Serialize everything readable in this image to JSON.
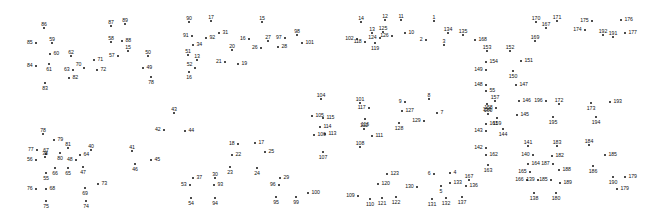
{
  "page": {
    "background_color": "#ffffff",
    "dot_color": "#111111",
    "label_color": "#111111",
    "width": 663,
    "height": 214,
    "total_dots": 195
  },
  "dots": [
    {
      "n": "86",
      "x": 44,
      "y": 28,
      "lp": "lp-t"
    },
    {
      "n": "85",
      "x": 36,
      "y": 43,
      "lp": "lp-l"
    },
    {
      "n": "59",
      "x": 52,
      "y": 43,
      "lp": "lp-t"
    },
    {
      "n": "60",
      "x": 50,
      "y": 54,
      "lp": "lp-r"
    },
    {
      "n": "61",
      "x": 49,
      "y": 64,
      "lp": "lp-b"
    },
    {
      "n": "84",
      "x": 36,
      "y": 66,
      "lp": "lp-l"
    },
    {
      "n": "83",
      "x": 45,
      "y": 83,
      "lp": "lp-b"
    },
    {
      "n": "62",
      "x": 71,
      "y": 56,
      "lp": "lp-t"
    },
    {
      "n": "63",
      "x": 73,
      "y": 70,
      "lp": "lp-l"
    },
    {
      "n": "70",
      "x": 84,
      "y": 68,
      "lp": "lp-tl"
    },
    {
      "n": "71",
      "x": 94,
      "y": 60,
      "lp": "lp-r"
    },
    {
      "n": "72",
      "x": 97,
      "y": 70,
      "lp": "lp-r"
    },
    {
      "n": "82",
      "x": 69,
      "y": 78,
      "lp": "lp-r"
    },
    {
      "n": "87",
      "x": 111,
      "y": 26,
      "lp": "lp-t"
    },
    {
      "n": "89",
      "x": 125,
      "y": 24,
      "lp": "lp-t"
    },
    {
      "n": "58",
      "x": 111,
      "y": 42,
      "lp": "lp-t"
    },
    {
      "n": "88",
      "x": 122,
      "y": 41,
      "lp": "lp-r"
    },
    {
      "n": "15",
      "x": 128,
      "y": 51,
      "lp": "lp-t"
    },
    {
      "n": "57",
      "x": 118,
      "y": 56,
      "lp": "lp-l"
    },
    {
      "n": "50",
      "x": 148,
      "y": 56,
      "lp": "lp-t"
    },
    {
      "n": "49",
      "x": 143,
      "y": 68,
      "lp": "lp-r"
    },
    {
      "n": "78",
      "x": 151,
      "y": 77,
      "lp": "lp-b"
    },
    {
      "n": "90",
      "x": 189,
      "y": 22,
      "lp": "lp-t"
    },
    {
      "n": "17",
      "x": 211,
      "y": 21,
      "lp": "lp-t"
    },
    {
      "n": "31",
      "x": 219,
      "y": 33,
      "lp": "lp-r"
    },
    {
      "n": "91",
      "x": 192,
      "y": 36,
      "lp": "lp-l"
    },
    {
      "n": "92",
      "x": 206,
      "y": 38,
      "lp": "lp-r"
    },
    {
      "n": "34",
      "x": 193,
      "y": 45,
      "lp": "lp-r"
    },
    {
      "n": "51",
      "x": 188,
      "y": 55,
      "lp": "lp-t"
    },
    {
      "n": "13",
      "x": 197,
      "y": 60,
      "lp": "lp-t"
    },
    {
      "n": "52",
      "x": 195,
      "y": 68,
      "lp": "lp-tl"
    },
    {
      "n": "16",
      "x": 189,
      "y": 72,
      "lp": "lp-b"
    },
    {
      "n": "20",
      "x": 232,
      "y": 50,
      "lp": "lp-t"
    },
    {
      "n": "21",
      "x": 225,
      "y": 62,
      "lp": "lp-l"
    },
    {
      "n": "19",
      "x": 238,
      "y": 64,
      "lp": "lp-r"
    },
    {
      "n": "15",
      "x": 262,
      "y": 22,
      "lp": "lp-t"
    },
    {
      "n": "16",
      "x": 249,
      "y": 39,
      "lp": "lp-l"
    },
    {
      "n": "27",
      "x": 268,
      "y": 41,
      "lp": "lp-t"
    },
    {
      "n": "26",
      "x": 261,
      "y": 48,
      "lp": "lp-l"
    },
    {
      "n": "28",
      "x": 278,
      "y": 47,
      "lp": "lp-r"
    },
    {
      "n": "97",
      "x": 285,
      "y": 38,
      "lp": "lp-l"
    },
    {
      "n": "98",
      "x": 297,
      "y": 35,
      "lp": "lp-t"
    },
    {
      "n": "101",
      "x": 302,
      "y": 43,
      "lp": "lp-r"
    },
    {
      "n": "14",
      "x": 361,
      "y": 22,
      "lp": "lp-t"
    },
    {
      "n": "12",
      "x": 385,
      "y": 20,
      "lp": "lp-t"
    },
    {
      "n": "11",
      "x": 401,
      "y": 20,
      "lp": "lp-t"
    },
    {
      "n": "13",
      "x": 372,
      "y": 33,
      "lp": "lp-t"
    },
    {
      "n": "125",
      "x": 383,
      "y": 32,
      "lp": "lp-t"
    },
    {
      "n": "102",
      "x": 357,
      "y": 39,
      "lp": "lp-l"
    },
    {
      "n": "118",
      "x": 365,
      "y": 42,
      "lp": "lp-l"
    },
    {
      "n": "124",
      "x": 380,
      "y": 38,
      "lp": "lp-l"
    },
    {
      "n": "119",
      "x": 375,
      "y": 43,
      "lp": "lp-b"
    },
    {
      "n": "126",
      "x": 392,
      "y": 36,
      "lp": "lp-l"
    },
    {
      "n": "10",
      "x": 405,
      "y": 33,
      "lp": "lp-r"
    },
    {
      "n": "1",
      "x": 434,
      "y": 21,
      "lp": "lp-t"
    },
    {
      "n": "2",
      "x": 426,
      "y": 40,
      "lp": "lp-l"
    },
    {
      "n": "134",
      "x": 448,
      "y": 33,
      "lp": "lp-t"
    },
    {
      "n": "135",
      "x": 463,
      "y": 35,
      "lp": "lp-t"
    },
    {
      "n": "3",
      "x": 444,
      "y": 45,
      "lp": "lp-t"
    },
    {
      "n": "168",
      "x": 475,
      "y": 40,
      "lp": "lp-r"
    },
    {
      "n": "153",
      "x": 487,
      "y": 51,
      "lp": "lp-t"
    },
    {
      "n": "152",
      "x": 510,
      "y": 51,
      "lp": "lp-t"
    },
    {
      "n": "154",
      "x": 486,
      "y": 62,
      "lp": "lp-r"
    },
    {
      "n": "151",
      "x": 521,
      "y": 61,
      "lp": "lp-r"
    },
    {
      "n": "149",
      "x": 486,
      "y": 70,
      "lp": "lp-l"
    },
    {
      "n": "150",
      "x": 513,
      "y": 71,
      "lp": "lp-b"
    },
    {
      "n": "148",
      "x": 486,
      "y": 85,
      "lp": "lp-l"
    },
    {
      "n": "147",
      "x": 516,
      "y": 85,
      "lp": "lp-r"
    },
    {
      "n": "55",
      "x": 486,
      "y": 91,
      "lp": "lp-r"
    },
    {
      "n": "156",
      "x": 487,
      "y": 104,
      "lp": "lp-b"
    },
    {
      "n": "157",
      "x": 495,
      "y": 101,
      "lp": "lp-t"
    },
    {
      "n": "146",
      "x": 519,
      "y": 101,
      "lp": "lp-r"
    },
    {
      "n": "196",
      "x": 546,
      "y": 101,
      "lp": "lp-l"
    },
    {
      "n": "172",
      "x": 559,
      "y": 104,
      "lp": "lp-t"
    },
    {
      "n": "158",
      "x": 496,
      "y": 108,
      "lp": "lp-l"
    },
    {
      "n": "160",
      "x": 488,
      "y": 114,
      "lp": "lp-t"
    },
    {
      "n": "159",
      "x": 497,
      "y": 118,
      "lp": "lp-b"
    },
    {
      "n": "145",
      "x": 517,
      "y": 115,
      "lp": "lp-r"
    },
    {
      "n": "195",
      "x": 553,
      "y": 117,
      "lp": "lp-b"
    },
    {
      "n": "161",
      "x": 486,
      "y": 124,
      "lp": "lp-r"
    },
    {
      "n": "143",
      "x": 486,
      "y": 131,
      "lp": "lp-l"
    },
    {
      "n": "144",
      "x": 503,
      "y": 129,
      "lp": "lp-b"
    },
    {
      "n": "142",
      "x": 486,
      "y": 148,
      "lp": "lp-l"
    },
    {
      "n": "162",
      "x": 486,
      "y": 155,
      "lp": "lp-r"
    },
    {
      "n": "163",
      "x": 488,
      "y": 165,
      "lp": "lp-b"
    },
    {
      "n": "141",
      "x": 528,
      "y": 146,
      "lp": "lp-t"
    },
    {
      "n": "183",
      "x": 557,
      "y": 146,
      "lp": "lp-t"
    },
    {
      "n": "140",
      "x": 533,
      "y": 155,
      "lp": "lp-l"
    },
    {
      "n": "182",
      "x": 552,
      "y": 156,
      "lp": "lp-r"
    },
    {
      "n": "164",
      "x": 528,
      "y": 164,
      "lp": "lp-r"
    },
    {
      "n": "187",
      "x": 553,
      "y": 164,
      "lp": "lp-l"
    },
    {
      "n": "165",
      "x": 530,
      "y": 172,
      "lp": "lp-l"
    },
    {
      "n": "188",
      "x": 559,
      "y": 170,
      "lp": "lp-r"
    },
    {
      "n": "166",
      "x": 527,
      "y": 180,
      "lp": "lp-l"
    },
    {
      "n": "139",
      "x": 538,
      "y": 180,
      "lp": "lp-l"
    },
    {
      "n": "185",
      "x": 551,
      "y": 180,
      "lp": "lp-l"
    },
    {
      "n": "189",
      "x": 560,
      "y": 183,
      "lp": "lp-r"
    },
    {
      "n": "138",
      "x": 534,
      "y": 193,
      "lp": "lp-b"
    },
    {
      "n": "180",
      "x": 556,
      "y": 193,
      "lp": "lp-b"
    },
    {
      "n": "170",
      "x": 536,
      "y": 22,
      "lp": "lp-t"
    },
    {
      "n": "171",
      "x": 557,
      "y": 21,
      "lp": "lp-t"
    },
    {
      "n": "167",
      "x": 546,
      "y": 28,
      "lp": "lp-t"
    },
    {
      "n": "169",
      "x": 535,
      "y": 41,
      "lp": "lp-t"
    },
    {
      "n": "175",
      "x": 592,
      "y": 21,
      "lp": "lp-l"
    },
    {
      "n": "176",
      "x": 621,
      "y": 20,
      "lp": "lp-r"
    },
    {
      "n": "174",
      "x": 585,
      "y": 30,
      "lp": "lp-l"
    },
    {
      "n": "192",
      "x": 603,
      "y": 35,
      "lp": "lp-t"
    },
    {
      "n": "191",
      "x": 613,
      "y": 37,
      "lp": "lp-t"
    },
    {
      "n": "177",
      "x": 625,
      "y": 33,
      "lp": "lp-r"
    },
    {
      "n": "173",
      "x": 591,
      "y": 103,
      "lp": "lp-b"
    },
    {
      "n": "193",
      "x": 610,
      "y": 102,
      "lp": "lp-r"
    },
    {
      "n": "194",
      "x": 596,
      "y": 117,
      "lp": "lp-b"
    },
    {
      "n": "184",
      "x": 589,
      "y": 145,
      "lp": "lp-t"
    },
    {
      "n": "185",
      "x": 605,
      "y": 155,
      "lp": "lp-r"
    },
    {
      "n": "186",
      "x": 593,
      "y": 166,
      "lp": "lp-b"
    },
    {
      "n": "190",
      "x": 613,
      "y": 177,
      "lp": "lp-b"
    },
    {
      "n": "179",
      "x": 625,
      "y": 177,
      "lp": "lp-r"
    },
    {
      "n": "179",
      "x": 617,
      "y": 189,
      "lp": "lp-r"
    },
    {
      "n": "104",
      "x": 321,
      "y": 99,
      "lp": "lp-t"
    },
    {
      "n": "105",
      "x": 312,
      "y": 116,
      "lp": "lp-r"
    },
    {
      "n": "115",
      "x": 323,
      "y": 118,
      "lp": "lp-r"
    },
    {
      "n": "114",
      "x": 320,
      "y": 127,
      "lp": "lp-r"
    },
    {
      "n": "106",
      "x": 314,
      "y": 135,
      "lp": "lp-r"
    },
    {
      "n": "113",
      "x": 325,
      "y": 134,
      "lp": "lp-r"
    },
    {
      "n": "107",
      "x": 323,
      "y": 152,
      "lp": "lp-b"
    },
    {
      "n": "101",
      "x": 360,
      "y": 103,
      "lp": "lp-t"
    },
    {
      "n": "117",
      "x": 369,
      "y": 108,
      "lp": "lp-l"
    },
    {
      "n": "116",
      "x": 365,
      "y": 119,
      "lp": "lp-b"
    },
    {
      "n": "112",
      "x": 364,
      "y": 129,
      "lp": "lp-t"
    },
    {
      "n": "111",
      "x": 372,
      "y": 136,
      "lp": "lp-r"
    },
    {
      "n": "108",
      "x": 360,
      "y": 147,
      "lp": "lp-t"
    },
    {
      "n": "9",
      "x": 405,
      "y": 102,
      "lp": "lp-l"
    },
    {
      "n": "127",
      "x": 402,
      "y": 111,
      "lp": "lp-r"
    },
    {
      "n": "128",
      "x": 399,
      "y": 123,
      "lp": "lp-b"
    },
    {
      "n": "8",
      "x": 429,
      "y": 99,
      "lp": "lp-t"
    },
    {
      "n": "7",
      "x": 437,
      "y": 113,
      "lp": "lp-r"
    },
    {
      "n": "129",
      "x": 424,
      "y": 121,
      "lp": "lp-l"
    },
    {
      "n": "123",
      "x": 387,
      "y": 174,
      "lp": "lp-r"
    },
    {
      "n": "120",
      "x": 378,
      "y": 184,
      "lp": "lp-r"
    },
    {
      "n": "109",
      "x": 358,
      "y": 196,
      "lp": "lp-l"
    },
    {
      "n": "110",
      "x": 370,
      "y": 199,
      "lp": "lp-b"
    },
    {
      "n": "121",
      "x": 382,
      "y": 198,
      "lp": "lp-b"
    },
    {
      "n": "122",
      "x": 396,
      "y": 197,
      "lp": "lp-b"
    },
    {
      "n": "6",
      "x": 434,
      "y": 174,
      "lp": "lp-l"
    },
    {
      "n": "4",
      "x": 450,
      "y": 173,
      "lp": "lp-r"
    },
    {
      "n": "5",
      "x": 441,
      "y": 186,
      "lp": "lp-b"
    },
    {
      "n": "133",
      "x": 450,
      "y": 183,
      "lp": "lp-r"
    },
    {
      "n": "130",
      "x": 417,
      "y": 187,
      "lp": "lp-l"
    },
    {
      "n": "131",
      "x": 432,
      "y": 199,
      "lp": "lp-b"
    },
    {
      "n": "132",
      "x": 446,
      "y": 198,
      "lp": "lp-b"
    },
    {
      "n": "167",
      "x": 469,
      "y": 180,
      "lp": "lp-t"
    },
    {
      "n": "136",
      "x": 466,
      "y": 186,
      "lp": "lp-r"
    },
    {
      "n": "137",
      "x": 462,
      "y": 197,
      "lp": "lp-b"
    },
    {
      "n": "43",
      "x": 174,
      "y": 113,
      "lp": "lp-t"
    },
    {
      "n": "42",
      "x": 164,
      "y": 130,
      "lp": "lp-l"
    },
    {
      "n": "44",
      "x": 185,
      "y": 131,
      "lp": "lp-r"
    },
    {
      "n": "41",
      "x": 132,
      "y": 151,
      "lp": "lp-t"
    },
    {
      "n": "45",
      "x": 151,
      "y": 160,
      "lp": "lp-r"
    },
    {
      "n": "46",
      "x": 135,
      "y": 164,
      "lp": "lp-b"
    },
    {
      "n": "40",
      "x": 91,
      "y": 150,
      "lp": "lp-t"
    },
    {
      "n": "48",
      "x": 76,
      "y": 160,
      "lp": "lp-l"
    },
    {
      "n": "47",
      "x": 83,
      "y": 167,
      "lp": "lp-b"
    },
    {
      "n": "38",
      "x": 45,
      "y": 157,
      "lp": "lp-t"
    },
    {
      "n": "56",
      "x": 36,
      "y": 160,
      "lp": "lp-l"
    },
    {
      "n": "55",
      "x": 46,
      "y": 173,
      "lp": "lp-b"
    },
    {
      "n": "78",
      "x": 43,
      "y": 134,
      "lp": "lp-t"
    },
    {
      "n": "79",
      "x": 54,
      "y": 140,
      "lp": "lp-r"
    },
    {
      "n": "77",
      "x": 37,
      "y": 150,
      "lp": "lp-l"
    },
    {
      "n": "67",
      "x": 46,
      "y": 154,
      "lp": "lp-t"
    },
    {
      "n": "80",
      "x": 60,
      "y": 153,
      "lp": "lp-b"
    },
    {
      "n": "81",
      "x": 68,
      "y": 148,
      "lp": "lp-t"
    },
    {
      "n": "64",
      "x": 80,
      "y": 155,
      "lp": "lp-r"
    },
    {
      "n": "66",
      "x": 55,
      "y": 168,
      "lp": "lp-b"
    },
    {
      "n": "65",
      "x": 68,
      "y": 168,
      "lp": "lp-b"
    },
    {
      "n": "76",
      "x": 36,
      "y": 189,
      "lp": "lp-l"
    },
    {
      "n": "68",
      "x": 46,
      "y": 189,
      "lp": "lp-r"
    },
    {
      "n": "75",
      "x": 46,
      "y": 201,
      "lp": "lp-b"
    },
    {
      "n": "69",
      "x": 85,
      "y": 188,
      "lp": "lp-b"
    },
    {
      "n": "73",
      "x": 98,
      "y": 184,
      "lp": "lp-r"
    },
    {
      "n": "74",
      "x": 86,
      "y": 201,
      "lp": "lp-b"
    },
    {
      "n": "18",
      "x": 238,
      "y": 144,
      "lp": "lp-l"
    },
    {
      "n": "22",
      "x": 232,
      "y": 155,
      "lp": "lp-r"
    },
    {
      "n": "23",
      "x": 230,
      "y": 167,
      "lp": "lp-b"
    },
    {
      "n": "17",
      "x": 255,
      "y": 143,
      "lp": "lp-r"
    },
    {
      "n": "25",
      "x": 265,
      "y": 152,
      "lp": "lp-r"
    },
    {
      "n": "24",
      "x": 257,
      "y": 168,
      "lp": "lp-b"
    },
    {
      "n": "37",
      "x": 193,
      "y": 178,
      "lp": "lp-r"
    },
    {
      "n": "53",
      "x": 190,
      "y": 185,
      "lp": "lp-l"
    },
    {
      "n": "54",
      "x": 191,
      "y": 198,
      "lp": "lp-b"
    },
    {
      "n": "30",
      "x": 215,
      "y": 178,
      "lp": "lp-t"
    },
    {
      "n": "93",
      "x": 214,
      "y": 185,
      "lp": "lp-r"
    },
    {
      "n": "94",
      "x": 215,
      "y": 198,
      "lp": "lp-b"
    },
    {
      "n": "29",
      "x": 280,
      "y": 178,
      "lp": "lp-r"
    },
    {
      "n": "96",
      "x": 279,
      "y": 185,
      "lp": "lp-l"
    },
    {
      "n": "95",
      "x": 276,
      "y": 197,
      "lp": "lp-b"
    },
    {
      "n": "99",
      "x": 296,
      "y": 197,
      "lp": "lp-b"
    },
    {
      "n": "100",
      "x": 308,
      "y": 193,
      "lp": "lp-r"
    }
  ]
}
